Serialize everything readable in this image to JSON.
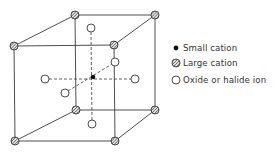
{
  "figure": {
    "type": "perovskite-unit-cell",
    "line_color": "#3a3a3a",
    "cube": {
      "front": [
        [
          14,
          46
        ],
        [
          114,
          45
        ],
        [
          115,
          141
        ],
        [
          15,
          141
        ]
      ],
      "back": [
        [
          75,
          15
        ],
        [
          155,
          15
        ],
        [
          155,
          110
        ],
        [
          76,
          110
        ]
      ]
    },
    "center_small_cation": [
      93,
      77
    ],
    "anions": [
      [
        91,
        28
      ],
      [
        92,
        124
      ],
      [
        45,
        79
      ],
      [
        135,
        79
      ],
      [
        65,
        93
      ],
      [
        115,
        62
      ]
    ]
  },
  "legend": {
    "items": [
      {
        "symbol": "small-cation",
        "label": "Small cation"
      },
      {
        "symbol": "large-cation",
        "label": "Large cation"
      },
      {
        "symbol": "anion",
        "label": "Oxide or halide ion"
      }
    ]
  },
  "caption": {
    "text": ""
  }
}
